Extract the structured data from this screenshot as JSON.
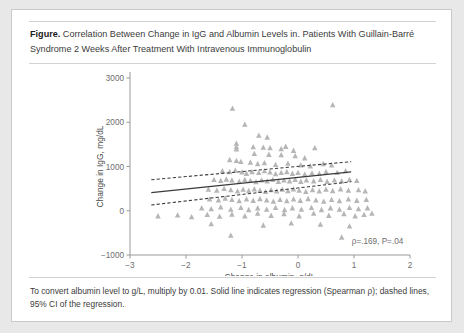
{
  "figure": {
    "label": "Figure.",
    "title": "Correlation Between Change in IgG and Albumin Levels in. Patients With Guillain-Barré Syndrome 2 Weeks After Treatment With Intravenous Immunoglobulin",
    "footnote": "To convert albumin level to g/L, multiply by 0.01. Solid line indicates regression (Spearman ρ); dashed lines, 95% CI of the regression."
  },
  "chart_data": {
    "type": "scatter",
    "title": "",
    "xlabel": "Change in albumin, g/dL",
    "ylabel": "Change in IgG, mg/dL",
    "xlim": [
      -3,
      2
    ],
    "ylim": [
      -1000,
      3000
    ],
    "xticks": [
      -3,
      -2,
      -1,
      0,
      1,
      2
    ],
    "xticklabels": [
      "−3",
      "−2",
      "−1",
      "0",
      "1",
      "2"
    ],
    "yticks": [
      -1000,
      0,
      1000,
      2000,
      3000
    ],
    "yticklabels": [
      "−1000",
      "0",
      "1000",
      "2000",
      "3000"
    ],
    "grid": false,
    "legend": null,
    "marker": "triangle-up",
    "marker_color": "#b6b6b6",
    "annotation": "ρ=.169, P=.04",
    "annotation_x": 1.42,
    "annotation_y": -760,
    "regression": {
      "name": "Solid line indicates regression (Spearman ρ)",
      "x": [
        -2.62,
        0.95
      ],
      "y": [
        410,
        880
      ],
      "style": "solid"
    },
    "ci_upper": {
      "name": "95% CI upper",
      "x": [
        -2.62,
        0.95
      ],
      "y": [
        700,
        1110
      ],
      "style": "dashed"
    },
    "ci_lower": {
      "name": "95% CI lower",
      "x": [
        -2.62,
        0.95
      ],
      "y": [
        130,
        655
      ],
      "style": "dashed"
    },
    "series": [
      {
        "name": "Patients",
        "points": [
          [
            -1.17,
            2310
          ],
          [
            0.62,
            2390
          ],
          [
            -0.95,
            1950
          ],
          [
            -0.7,
            1700
          ],
          [
            -0.55,
            1660
          ],
          [
            -1.1,
            1520
          ],
          [
            -1.1,
            1440
          ],
          [
            -1.1,
            1390
          ],
          [
            -0.8,
            1440
          ],
          [
            -0.62,
            1430
          ],
          [
            -0.5,
            1420
          ],
          [
            -0.3,
            1400
          ],
          [
            -0.22,
            1450
          ],
          [
            -0.08,
            1360
          ],
          [
            0.3,
            1420
          ],
          [
            -0.78,
            1290
          ],
          [
            -0.52,
            1270
          ],
          [
            -0.3,
            1260
          ],
          [
            -0.05,
            1240
          ],
          [
            0.12,
            1190
          ],
          [
            -1.22,
            1150
          ],
          [
            -1.1,
            1130
          ],
          [
            -1.02,
            1110
          ],
          [
            -0.85,
            1090
          ],
          [
            -0.72,
            1060
          ],
          [
            -0.6,
            1080
          ],
          [
            -0.4,
            1040
          ],
          [
            -0.18,
            1070
          ],
          [
            0.05,
            1030
          ],
          [
            0.22,
            1010
          ],
          [
            0.45,
            1060
          ],
          [
            0.6,
            1030
          ],
          [
            -1.35,
            900
          ],
          [
            -1.22,
            880
          ],
          [
            -1.12,
            910
          ],
          [
            -1.0,
            870
          ],
          [
            -0.92,
            840
          ],
          [
            -0.82,
            880
          ],
          [
            -0.7,
            860
          ],
          [
            -0.6,
            900
          ],
          [
            -0.5,
            870
          ],
          [
            -0.4,
            830
          ],
          [
            -0.3,
            860
          ],
          [
            -0.2,
            880
          ],
          [
            -0.1,
            840
          ],
          [
            0.0,
            860
          ],
          [
            0.12,
            820
          ],
          [
            0.25,
            850
          ],
          [
            0.38,
            840
          ],
          [
            0.5,
            880
          ],
          [
            0.7,
            860
          ],
          [
            0.85,
            900
          ],
          [
            -1.5,
            700
          ],
          [
            -1.38,
            680
          ],
          [
            -1.28,
            710
          ],
          [
            -1.18,
            690
          ],
          [
            -1.05,
            660
          ],
          [
            -0.95,
            700
          ],
          [
            -0.85,
            680
          ],
          [
            -0.75,
            650
          ],
          [
            -0.65,
            690
          ],
          [
            -0.55,
            670
          ],
          [
            -0.45,
            700
          ],
          [
            -0.35,
            660
          ],
          [
            -0.25,
            690
          ],
          [
            -0.15,
            670
          ],
          [
            -0.05,
            700
          ],
          [
            0.05,
            660
          ],
          [
            0.15,
            690
          ],
          [
            0.28,
            670
          ],
          [
            0.4,
            700
          ],
          [
            0.52,
            660
          ],
          [
            0.65,
            690
          ],
          [
            0.78,
            670
          ],
          [
            0.92,
            700
          ],
          [
            1.05,
            680
          ],
          [
            -1.6,
            480
          ],
          [
            -1.45,
            460
          ],
          [
            -1.32,
            500
          ],
          [
            -1.2,
            470
          ],
          [
            -1.08,
            440
          ],
          [
            -0.98,
            480
          ],
          [
            -0.88,
            450
          ],
          [
            -0.78,
            490
          ],
          [
            -0.68,
            460
          ],
          [
            -0.58,
            430
          ],
          [
            -0.48,
            470
          ],
          [
            -0.38,
            440
          ],
          [
            -0.28,
            480
          ],
          [
            -0.18,
            450
          ],
          [
            -0.08,
            490
          ],
          [
            0.02,
            460
          ],
          [
            0.14,
            430
          ],
          [
            0.26,
            470
          ],
          [
            0.38,
            440
          ],
          [
            0.5,
            480
          ],
          [
            0.62,
            450
          ],
          [
            0.76,
            490
          ],
          [
            0.9,
            460
          ],
          [
            1.08,
            470
          ],
          [
            1.2,
            440
          ],
          [
            -1.58,
            260
          ],
          [
            -1.42,
            240
          ],
          [
            -1.3,
            280
          ],
          [
            -1.18,
            250
          ],
          [
            -1.05,
            220
          ],
          [
            -0.92,
            260
          ],
          [
            -0.8,
            230
          ],
          [
            -0.68,
            270
          ],
          [
            -0.56,
            240
          ],
          [
            -0.44,
            210
          ],
          [
            -0.32,
            250
          ],
          [
            -0.2,
            220
          ],
          [
            -0.08,
            260
          ],
          [
            0.04,
            230
          ],
          [
            0.18,
            270
          ],
          [
            0.32,
            240
          ],
          [
            0.46,
            210
          ],
          [
            0.6,
            250
          ],
          [
            0.74,
            220
          ],
          [
            0.9,
            260
          ],
          [
            1.05,
            230
          ],
          [
            1.22,
            250
          ],
          [
            -1.72,
            60
          ],
          [
            -1.55,
            40
          ],
          [
            -1.38,
            80
          ],
          [
            -1.2,
            30
          ],
          [
            -1.02,
            70
          ],
          [
            -0.88,
            20
          ],
          [
            -0.72,
            60
          ],
          [
            -0.56,
            30
          ],
          [
            -0.4,
            70
          ],
          [
            -0.24,
            20
          ],
          [
            -0.1,
            60
          ],
          [
            0.06,
            30
          ],
          [
            0.24,
            70
          ],
          [
            0.42,
            20
          ],
          [
            0.58,
            60
          ],
          [
            0.74,
            30
          ],
          [
            0.92,
            70
          ],
          [
            1.08,
            40
          ],
          [
            1.24,
            60
          ],
          [
            -2.5,
            -120
          ],
          [
            -2.15,
            -100
          ],
          [
            -1.9,
            -140
          ],
          [
            -1.62,
            -90
          ],
          [
            -1.4,
            -130
          ],
          [
            -1.18,
            -80
          ],
          [
            -0.95,
            -120
          ],
          [
            -0.72,
            -60
          ],
          [
            -0.48,
            -110
          ],
          [
            -0.25,
            -70
          ],
          [
            0.02,
            -120
          ],
          [
            0.28,
            -60
          ],
          [
            0.55,
            -110
          ],
          [
            0.82,
            -70
          ],
          [
            1.02,
            -120
          ],
          [
            1.18,
            -90
          ],
          [
            1.32,
            -60
          ],
          [
            -1.55,
            -300
          ],
          [
            -0.62,
            -330
          ],
          [
            -0.12,
            -280
          ],
          [
            0.4,
            -310
          ],
          [
            0.92,
            -350
          ],
          [
            -1.2,
            -560
          ],
          [
            0.78,
            -600
          ]
        ]
      }
    ]
  }
}
